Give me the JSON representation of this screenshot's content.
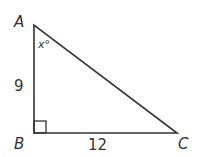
{
  "diagram": {
    "type": "right-triangle",
    "vertices": {
      "A": {
        "label": "A",
        "x": 34,
        "y": 25
      },
      "B": {
        "label": "B",
        "x": 34,
        "y": 133
      },
      "C": {
        "label": "C",
        "x": 177,
        "y": 133
      }
    },
    "sides": {
      "AB": {
        "label": "9"
      },
      "BC": {
        "label": "12"
      }
    },
    "angle_A": {
      "label": "x°"
    },
    "right_angle_at": "B",
    "stroke_color": "#333333"
  }
}
